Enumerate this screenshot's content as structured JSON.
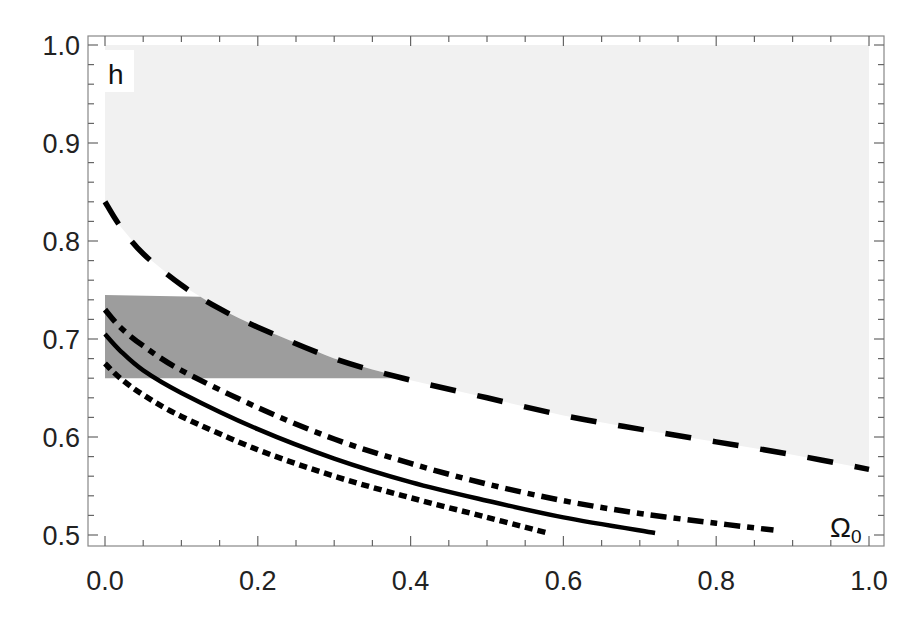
{
  "chart_data": {
    "type": "line",
    "title": "",
    "xlabel": "Ω0",
    "xlabel_main": "Ω",
    "xlabel_sub": "0",
    "ylabel": "h",
    "xlim": [
      0.0,
      1.0
    ],
    "ylim": [
      0.5,
      1.0
    ],
    "grid": false,
    "legend": null,
    "x_ticks": [
      {
        "value": 0.0,
        "label": "0.0"
      },
      {
        "value": 0.2,
        "label": "0.2"
      },
      {
        "value": 0.4,
        "label": "0.4"
      },
      {
        "value": 0.6,
        "label": "0.6"
      },
      {
        "value": 0.8,
        "label": "0.8"
      },
      {
        "value": 1.0,
        "label": "1.0"
      }
    ],
    "y_ticks": [
      {
        "value": 0.5,
        "label": "0.5"
      },
      {
        "value": 0.6,
        "label": "0.6"
      },
      {
        "value": 0.7,
        "label": "0.7"
      },
      {
        "value": 0.8,
        "label": "0.8"
      },
      {
        "value": 0.9,
        "label": "0.9"
      },
      {
        "value": 1.0,
        "label": "1.0"
      }
    ],
    "regions": [
      {
        "name": "excluded-region-above-dashed",
        "fill": "#f1f1f1",
        "description": "light gray region above dashed curve up to h=1.0"
      },
      {
        "name": "observational-band",
        "fill": "#9d9d9d",
        "h_min": 0.66,
        "h_max": 0.745,
        "description": "dark gray band 0.66<=h<=0.745, bounded on the right by dashed curve"
      }
    ],
    "series": [
      {
        "name": "dashed-upper-bound",
        "style": "dashed",
        "color": "#000000",
        "points": [
          [
            0,
            0.84
          ],
          [
            0.02,
            0.815
          ],
          [
            0.05,
            0.787
          ],
          [
            0.1,
            0.755
          ],
          [
            0.15,
            0.731
          ],
          [
            0.2,
            0.712
          ],
          [
            0.3,
            0.68
          ],
          [
            0.4,
            0.658
          ],
          [
            0.5,
            0.64
          ],
          [
            0.6,
            0.622
          ],
          [
            0.7,
            0.608
          ],
          [
            0.8,
            0.595
          ],
          [
            0.9,
            0.582
          ],
          [
            1.0,
            0.567
          ]
        ]
      },
      {
        "name": "dash-dot",
        "style": "dashdot",
        "color": "#000000",
        "points": [
          [
            0,
            0.73
          ],
          [
            0.02,
            0.712
          ],
          [
            0.05,
            0.693
          ],
          [
            0.1,
            0.668
          ],
          [
            0.2,
            0.63
          ],
          [
            0.3,
            0.598
          ],
          [
            0.4,
            0.573
          ],
          [
            0.5,
            0.552
          ],
          [
            0.6,
            0.535
          ],
          [
            0.7,
            0.522
          ],
          [
            0.8,
            0.512
          ],
          [
            0.875,
            0.505
          ]
        ]
      },
      {
        "name": "solid",
        "style": "solid",
        "color": "#000000",
        "points": [
          [
            0,
            0.705
          ],
          [
            0.02,
            0.688
          ],
          [
            0.05,
            0.668
          ],
          [
            0.1,
            0.645
          ],
          [
            0.2,
            0.608
          ],
          [
            0.3,
            0.578
          ],
          [
            0.4,
            0.554
          ],
          [
            0.5,
            0.535
          ],
          [
            0.6,
            0.518
          ],
          [
            0.72,
            0.502
          ]
        ]
      },
      {
        "name": "dotted",
        "style": "dotted",
        "color": "#000000",
        "points": [
          [
            0,
            0.675
          ],
          [
            0.02,
            0.66
          ],
          [
            0.05,
            0.643
          ],
          [
            0.1,
            0.621
          ],
          [
            0.2,
            0.587
          ],
          [
            0.3,
            0.56
          ],
          [
            0.4,
            0.538
          ],
          [
            0.5,
            0.518
          ],
          [
            0.58,
            0.502
          ]
        ]
      }
    ]
  }
}
